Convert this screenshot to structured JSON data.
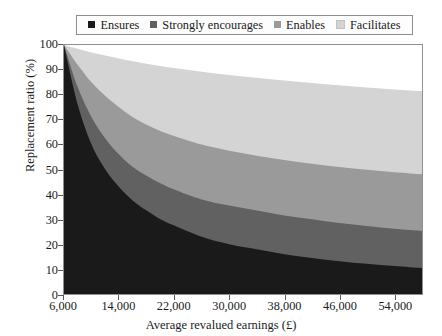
{
  "chart_data": {
    "type": "area",
    "stacked": true,
    "title": "",
    "xlabel": "Average revalued earnings (£)",
    "ylabel": "Replacement ratio (%)",
    "xlim": [
      6000,
      58000
    ],
    "ylim": [
      0,
      100
    ],
    "xticks": [
      6000,
      14000,
      22000,
      30000,
      38000,
      46000,
      54000
    ],
    "xticklabels": [
      "6,000",
      "14,000",
      "22,000",
      "30,000",
      "38,000",
      "46,000",
      "54,000"
    ],
    "yticks": [
      0,
      10,
      20,
      30,
      40,
      50,
      60,
      70,
      80,
      90,
      100
    ],
    "yticklabels": [
      "0",
      "10",
      "20",
      "30",
      "40",
      "50",
      "60",
      "70",
      "80",
      "90",
      "100"
    ],
    "grid": false,
    "legend_position": "top",
    "x": [
      6000,
      8000,
      10000,
      12000,
      14000,
      16000,
      18000,
      20000,
      22000,
      26000,
      30000,
      34000,
      38000,
      42000,
      46000,
      50000,
      54000,
      58000
    ],
    "series": [
      {
        "name": "Ensures",
        "color": "#1a1a1a",
        "values": [
          100,
          76,
          60,
          50,
          43,
          37.5,
          33.5,
          30,
          27.5,
          23,
          20,
          18,
          16,
          14.5,
          13.2,
          12.1,
          11.2,
          10.4
        ]
      },
      {
        "name": "Strongly encourages",
        "color": "#616161",
        "values": [
          100,
          83,
          71,
          62.5,
          56,
          51,
          47.5,
          44.5,
          42,
          38,
          35.5,
          33.5,
          31.5,
          30,
          28.5,
          27.3,
          26.2,
          25.3
        ]
      },
      {
        "name": "Enables",
        "color": "#9a9a9a",
        "values": [
          100,
          92,
          85,
          79.5,
          75,
          71,
          68,
          65.5,
          63.5,
          60,
          57.5,
          55.5,
          53.8,
          52.3,
          51,
          49.9,
          48.9,
          48.1
        ]
      },
      {
        "name": "Facilitates",
        "color": "#d4d4d4",
        "values": [
          100,
          98.5,
          97,
          95.8,
          94.6,
          93.5,
          92.5,
          91.6,
          90.8,
          89.3,
          88,
          86.8,
          85.7,
          84.7,
          83.8,
          82.9,
          82.1,
          81.4
        ]
      }
    ],
    "legend": [
      {
        "label": "Ensures",
        "color": "#1a1a1a"
      },
      {
        "label": "Strongly encourages",
        "color": "#616161"
      },
      {
        "label": "Enables",
        "color": "#9a9a9a"
      },
      {
        "label": "Facilitates",
        "color": "#d4d4d4"
      }
    ]
  }
}
